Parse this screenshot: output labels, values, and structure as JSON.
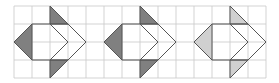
{
  "figure": {
    "grid_color": "#c8c8c8",
    "outline_color": "#555555",
    "panels": [
      {
        "id": "panel-1",
        "shade_color": "#808080"
      },
      {
        "id": "panel-2",
        "shade_color": "#808080"
      },
      {
        "id": "panel-3",
        "shade_color": "#d0d0d0"
      }
    ]
  }
}
